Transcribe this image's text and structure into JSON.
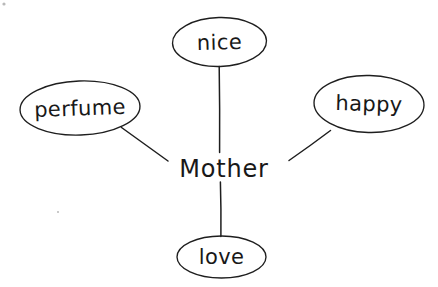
{
  "diagram": {
    "type": "word-web",
    "background_color": "#ffffff",
    "ink_color": "#1e1e1e",
    "center": {
      "id": "center-mother",
      "label": "Mother",
      "shape": "none",
      "cx": 224,
      "cy": 170,
      "font_size": 24
    },
    "nodes": [
      {
        "id": "node-nice",
        "label": "nice",
        "shape": "ellipse",
        "cx": 219.5,
        "cy": 42,
        "rx": 47,
        "ry": 24.5,
        "rotation": -1.5,
        "font_size": 21
      },
      {
        "id": "node-perfume",
        "label": "perfume",
        "shape": "ellipse",
        "cx": 80,
        "cy": 108,
        "rx": 60,
        "ry": 27,
        "rotation": -2,
        "font_size": 21
      },
      {
        "id": "node-happy",
        "label": "happy",
        "shape": "ellipse",
        "cx": 369,
        "cy": 104,
        "rx": 55,
        "ry": 28.5,
        "rotation": 1.5,
        "font_size": 21
      },
      {
        "id": "node-love",
        "label": "love",
        "shape": "ellipse",
        "cx": 221.5,
        "cy": 257,
        "rx": 44.5,
        "ry": 21,
        "rotation": 0,
        "font_size": 21
      }
    ],
    "edges": [
      {
        "id": "edge-mother-nice",
        "from": "center-mother",
        "to": "node-nice",
        "x1": 219.5,
        "y1": 66.5,
        "x2": 219.5,
        "y2": 152.5,
        "orientation": "vertical"
      },
      {
        "id": "edge-mother-perfume",
        "from": "center-mother",
        "to": "node-perfume",
        "x1": 121.5,
        "y1": 127.5,
        "x2": 168,
        "y2": 161,
        "orientation": "diagonal"
      },
      {
        "id": "edge-mother-happy",
        "from": "center-mother",
        "to": "node-happy",
        "x1": 330.5,
        "y1": 130.5,
        "x2": 289,
        "y2": 160.5,
        "orientation": "diagonal"
      },
      {
        "id": "edge-mother-love",
        "from": "center-mother",
        "to": "node-love",
        "x1": 220.5,
        "y1": 182,
        "x2": 221,
        "y2": 236.5,
        "orientation": "vertical"
      }
    ],
    "specks": [
      {
        "id": "speck-top-left",
        "cx": 4,
        "cy": 4,
        "r": 1.6
      },
      {
        "id": "speck-lower-left",
        "cx": 58,
        "cy": 212,
        "r": 1.0
      }
    ]
  }
}
